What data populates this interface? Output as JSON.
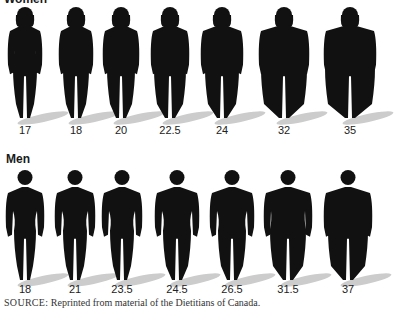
{
  "women": {
    "title": "Women",
    "figures": [
      {
        "bmi": "17",
        "x": 25,
        "w": 30,
        "hipw": 8
      },
      {
        "bmi": "18",
        "x": 76,
        "w": 30,
        "hipw": 9
      },
      {
        "bmi": "20",
        "x": 121,
        "w": 32,
        "hipw": 10
      },
      {
        "bmi": "22.5",
        "x": 170,
        "w": 34,
        "hipw": 12
      },
      {
        "bmi": "24",
        "x": 222,
        "w": 38,
        "hipw": 13
      },
      {
        "bmi": "32",
        "x": 284,
        "w": 46,
        "hipw": 19
      },
      {
        "bmi": "35",
        "x": 350,
        "w": 48,
        "hipw": 21
      }
    ]
  },
  "men": {
    "title": "Men",
    "figures": [
      {
        "bmi": "18",
        "x": 25,
        "w": 34,
        "hipw": 9
      },
      {
        "bmi": "21",
        "x": 75,
        "w": 36,
        "hipw": 10
      },
      {
        "bmi": "23.5",
        "x": 122,
        "w": 36,
        "hipw": 10
      },
      {
        "bmi": "24.5",
        "x": 177,
        "w": 40,
        "hipw": 12
      },
      {
        "bmi": "26.5",
        "x": 232,
        "w": 40,
        "hipw": 12
      },
      {
        "bmi": "31.5",
        "x": 288,
        "w": 44,
        "hipw": 16
      },
      {
        "bmi": "37",
        "x": 348,
        "w": 44,
        "hipw": 18
      }
    ]
  },
  "source": {
    "prefix": "SOURCE:",
    "text": " Reprinted from material of the Dietitians of Canada."
  }
}
